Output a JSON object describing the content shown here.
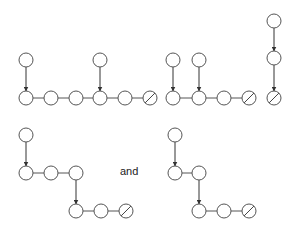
{
  "diagram": {
    "node_radius": 7,
    "colors": {
      "stroke": "#555555",
      "arrow": "#333333",
      "fill": "#ffffff",
      "background": "#ffffff"
    },
    "connector_label": "and",
    "figures": [
      {
        "name": "chain-two-branches",
        "nodes": [
          {
            "x": 26,
            "y": 60
          },
          {
            "x": 100,
            "y": 60
          },
          {
            "x": 26,
            "y": 98
          },
          {
            "x": 51,
            "y": 98
          },
          {
            "x": 76,
            "y": 98
          },
          {
            "x": 100,
            "y": 98
          },
          {
            "x": 125,
            "y": 98
          },
          {
            "x": 150,
            "y": 98,
            "null": true
          }
        ],
        "arrows": [
          [
            0,
            2
          ],
          [
            1,
            5
          ]
        ],
        "lines": [
          [
            2,
            3
          ],
          [
            3,
            4
          ],
          [
            4,
            5
          ],
          [
            5,
            6
          ],
          [
            6,
            7
          ]
        ]
      },
      {
        "name": "chain-adjacent-branches",
        "nodes": [
          {
            "x": 173,
            "y": 60
          },
          {
            "x": 199,
            "y": 60
          },
          {
            "x": 173,
            "y": 98
          },
          {
            "x": 199,
            "y": 98
          },
          {
            "x": 224,
            "y": 98
          },
          {
            "x": 249,
            "y": 98,
            "null": true
          }
        ],
        "arrows": [
          [
            0,
            2
          ],
          [
            1,
            3
          ]
        ],
        "lines": [
          [
            2,
            3
          ],
          [
            3,
            4
          ],
          [
            4,
            5
          ]
        ]
      },
      {
        "name": "vertical-chain",
        "nodes": [
          {
            "x": 274,
            "y": 21
          },
          {
            "x": 274,
            "y": 58
          },
          {
            "x": 274,
            "y": 98,
            "null": true
          }
        ],
        "arrows": [
          [
            0,
            1
          ],
          [
            1,
            2
          ]
        ],
        "lines": []
      },
      {
        "name": "staircase-left",
        "nodes": [
          {
            "x": 26,
            "y": 135
          },
          {
            "x": 26,
            "y": 173
          },
          {
            "x": 51,
            "y": 173
          },
          {
            "x": 76,
            "y": 173
          },
          {
            "x": 76,
            "y": 211
          },
          {
            "x": 101,
            "y": 211
          },
          {
            "x": 126,
            "y": 211,
            "null": true
          }
        ],
        "arrows": [
          [
            0,
            1
          ],
          [
            3,
            4
          ]
        ],
        "lines": [
          [
            1,
            2
          ],
          [
            2,
            3
          ],
          [
            4,
            5
          ],
          [
            5,
            6
          ]
        ]
      },
      {
        "name": "staircase-right",
        "nodes": [
          {
            "x": 175,
            "y": 135
          },
          {
            "x": 175,
            "y": 173
          },
          {
            "x": 199,
            "y": 173
          },
          {
            "x": 199,
            "y": 211
          },
          {
            "x": 224,
            "y": 211
          },
          {
            "x": 249,
            "y": 211,
            "null": true
          }
        ],
        "arrows": [
          [
            0,
            1
          ],
          [
            2,
            3
          ]
        ],
        "lines": [
          [
            1,
            2
          ],
          [
            3,
            4
          ],
          [
            4,
            5
          ]
        ]
      }
    ]
  }
}
